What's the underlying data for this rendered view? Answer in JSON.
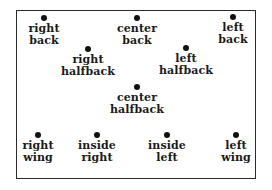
{
  "diagram": {
    "type": "field-positions",
    "positions": [
      {
        "id": "right-back",
        "line1": "right",
        "line2": "back",
        "x": 44,
        "y": 15
      },
      {
        "id": "center-back",
        "line1": "center",
        "line2": "back",
        "x": 137,
        "y": 15
      },
      {
        "id": "left-back",
        "line1": "left",
        "line2": "back",
        "x": 233,
        "y": 14
      },
      {
        "id": "right-halfback",
        "line1": "right",
        "line2": "halfback",
        "x": 88,
        "y": 46
      },
      {
        "id": "left-halfback",
        "line1": "left",
        "line2": "halfback",
        "x": 186,
        "y": 45
      },
      {
        "id": "center-halfback",
        "line1": "center",
        "line2": "halfback",
        "x": 137,
        "y": 84
      },
      {
        "id": "right-wing",
        "line1": "right",
        "line2": "wing",
        "x": 38,
        "y": 132
      },
      {
        "id": "inside-right",
        "line1": "inside",
        "line2": "right",
        "x": 97,
        "y": 132
      },
      {
        "id": "inside-left",
        "line1": "inside",
        "line2": "left",
        "x": 167,
        "y": 132
      },
      {
        "id": "left-wing",
        "line1": "left",
        "line2": "wing",
        "x": 236,
        "y": 132
      }
    ]
  }
}
